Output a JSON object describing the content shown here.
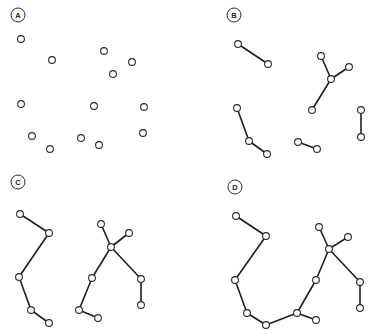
{
  "panels": [
    {
      "id": "A",
      "label": "A",
      "label_pos": [
        18,
        15
      ],
      "nodes": [
        [
          21,
          39
        ],
        [
          52,
          60
        ],
        [
          104,
          51
        ],
        [
          132,
          62
        ],
        [
          113,
          74
        ],
        [
          21,
          104
        ],
        [
          94,
          106
        ],
        [
          144,
          107
        ],
        [
          32,
          136
        ],
        [
          50,
          149
        ],
        [
          81,
          138
        ],
        [
          99,
          145
        ],
        [
          143,
          133
        ]
      ],
      "edges": []
    },
    {
      "id": "B",
      "label": "B",
      "label_pos": [
        234,
        15
      ],
      "nodes": [
        [
          238,
          44
        ],
        [
          268,
          64
        ],
        [
          321,
          56
        ],
        [
          331,
          79
        ],
        [
          349,
          67
        ],
        [
          312,
          110
        ],
        [
          237,
          108
        ],
        [
          249,
          141
        ],
        [
          267,
          154
        ],
        [
          298,
          142
        ],
        [
          317,
          149
        ],
        [
          361,
          110
        ],
        [
          361,
          137
        ]
      ],
      "edges": [
        [
          0,
          1
        ],
        [
          2,
          3
        ],
        [
          3,
          4
        ],
        [
          3,
          5
        ],
        [
          6,
          7
        ],
        [
          7,
          8
        ],
        [
          9,
          10
        ],
        [
          11,
          12
        ]
      ]
    },
    {
      "id": "C",
      "label": "C",
      "label_pos": [
        18,
        182
      ],
      "nodes": [
        [
          20,
          214
        ],
        [
          49,
          233
        ],
        [
          19,
          277
        ],
        [
          31,
          310
        ],
        [
          49,
          323
        ],
        [
          101,
          224
        ],
        [
          129,
          233
        ],
        [
          111,
          247
        ],
        [
          92,
          278
        ],
        [
          79,
          310
        ],
        [
          98,
          318
        ],
        [
          141,
          279
        ],
        [
          141,
          305
        ]
      ],
      "edges": [
        [
          0,
          1
        ],
        [
          1,
          2
        ],
        [
          2,
          3
        ],
        [
          3,
          4
        ],
        [
          5,
          7
        ],
        [
          6,
          7
        ],
        [
          7,
          8
        ],
        [
          8,
          9
        ],
        [
          9,
          10
        ],
        [
          7,
          11
        ],
        [
          11,
          12
        ]
      ]
    },
    {
      "id": "D",
      "label": "D",
      "label_pos": [
        235,
        187
      ],
      "nodes": [
        [
          236,
          216
        ],
        [
          266,
          236
        ],
        [
          235,
          280
        ],
        [
          247,
          313
        ],
        [
          266,
          325
        ],
        [
          297,
          313
        ],
        [
          316,
          280
        ],
        [
          329,
          249
        ],
        [
          319,
          227
        ],
        [
          348,
          237
        ],
        [
          360,
          282
        ],
        [
          360,
          308
        ],
        [
          316,
          320
        ]
      ],
      "edges": [
        [
          0,
          1
        ],
        [
          1,
          2
        ],
        [
          2,
          3
        ],
        [
          3,
          4
        ],
        [
          4,
          5
        ],
        [
          5,
          6
        ],
        [
          6,
          7
        ],
        [
          8,
          7
        ],
        [
          9,
          7
        ],
        [
          7,
          10
        ],
        [
          10,
          11
        ],
        [
          5,
          12
        ]
      ]
    }
  ],
  "style": {
    "node_radius": 3.4,
    "label_radius": 7,
    "edge_color": "#1e1e1e",
    "node_stroke": "#2a2a2a"
  }
}
